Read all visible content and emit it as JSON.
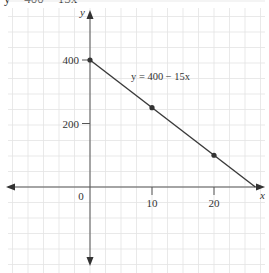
{
  "page": {
    "cut_off_header_text": "y = 400 − 15x"
  },
  "chart_data": {
    "type": "line",
    "title": "",
    "equation_label": "y = 400 − 15x",
    "xlabel": "x",
    "ylabel": "y",
    "x_ticks": [
      0,
      10,
      20
    ],
    "x_tick_labels": [
      "0",
      "10",
      "20"
    ],
    "y_ticks": [
      200,
      400
    ],
    "y_tick_labels": [
      "200",
      "400"
    ],
    "origin_label": "0",
    "grid": true,
    "xlim": [
      -14,
      28
    ],
    "ylim": [
      -270,
      590
    ],
    "series": [
      {
        "name": "y = 400 − 15x",
        "x": [
          0,
          26.67
        ],
        "y": [
          400,
          0
        ],
        "marked_points": [
          {
            "x": 0,
            "y": 400
          },
          {
            "x": 10,
            "y": 250
          },
          {
            "x": 20,
            "y": 100
          }
        ]
      }
    ],
    "colors": {
      "line": "#3a3a3a",
      "axes": "#555555",
      "grid": "#e3e3e3",
      "point": "#333333"
    }
  }
}
